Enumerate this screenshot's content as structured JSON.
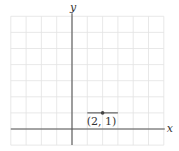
{
  "diagram": {
    "type": "coordinate-plane",
    "axes": {
      "x_label": "x",
      "y_label": "y",
      "x_range": [
        -4,
        6
      ],
      "y_range": [
        -1,
        7
      ]
    },
    "grid": true,
    "point": {
      "x": 2,
      "y": 1,
      "label": "(2, 1)"
    },
    "segment": {
      "from": [
        1,
        1
      ],
      "to": [
        3,
        1
      ]
    },
    "colors": {
      "grid": "#e2e2e2",
      "axis": "#555555",
      "segment": "#444444",
      "point": "#444444"
    }
  }
}
